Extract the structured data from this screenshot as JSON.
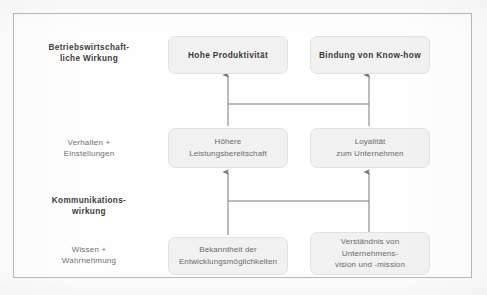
{
  "diagram": {
    "frame": {
      "border_color": "#b9b9b9",
      "background": "#fefefe"
    },
    "box_style": {
      "fill": "#f1f1f1",
      "border": "#e2e2e2",
      "text_color": "#4f4f4f"
    },
    "arrow_color": "#7a7a7a",
    "row_labels": [
      {
        "name": "betriebswirtschaftliche-wirkung",
        "line1": "Betriebswirtschaft-",
        "line2": "liche Wirkung",
        "weight": "bold"
      },
      {
        "name": "verhalten-einstellungen",
        "line1": "Verhalten +",
        "line2": "Einstellungen",
        "weight": "normal"
      },
      {
        "name": "kommunikationswirkung",
        "line1": "Kommunikations-",
        "line2": "wirkung",
        "weight": "bold"
      },
      {
        "name": "wissen-wahrnehmung",
        "line1": "Wissen +",
        "line2": "Wahrnehmung",
        "weight": "normal"
      }
    ],
    "nodes": {
      "top_left": {
        "line1": "Hohe Produktivität",
        "line2": "",
        "line3": ""
      },
      "top_right": {
        "line1": "Bindung von Know-how",
        "line2": "",
        "line3": ""
      },
      "mid_left": {
        "line1": "Höhere",
        "line2": "Leistungsbereitschaft",
        "line3": ""
      },
      "mid_right": {
        "line1": "Loyalität",
        "line2": "zum Unternehmen",
        "line3": ""
      },
      "bottom_left": {
        "line1": "Bekanntheit der",
        "line2": "Entwicklungsmöglichkeiten",
        "line3": ""
      },
      "bottom_right": {
        "line1": "Verständnis von",
        "line2": "Unternehmens-",
        "line3": "vision und -mission"
      }
    },
    "connectors": [
      {
        "name": "arrow-mid-left-to-top-left",
        "direction": "up"
      },
      {
        "name": "arrow-mid-right-to-top-right",
        "direction": "up"
      },
      {
        "name": "crossbar-upper",
        "direction": "horizontal"
      },
      {
        "name": "arrow-bottom-left-to-mid-left",
        "direction": "up"
      },
      {
        "name": "arrow-bottom-right-to-mid-right",
        "direction": "up"
      },
      {
        "name": "crossbar-lower",
        "direction": "horizontal"
      }
    ]
  }
}
